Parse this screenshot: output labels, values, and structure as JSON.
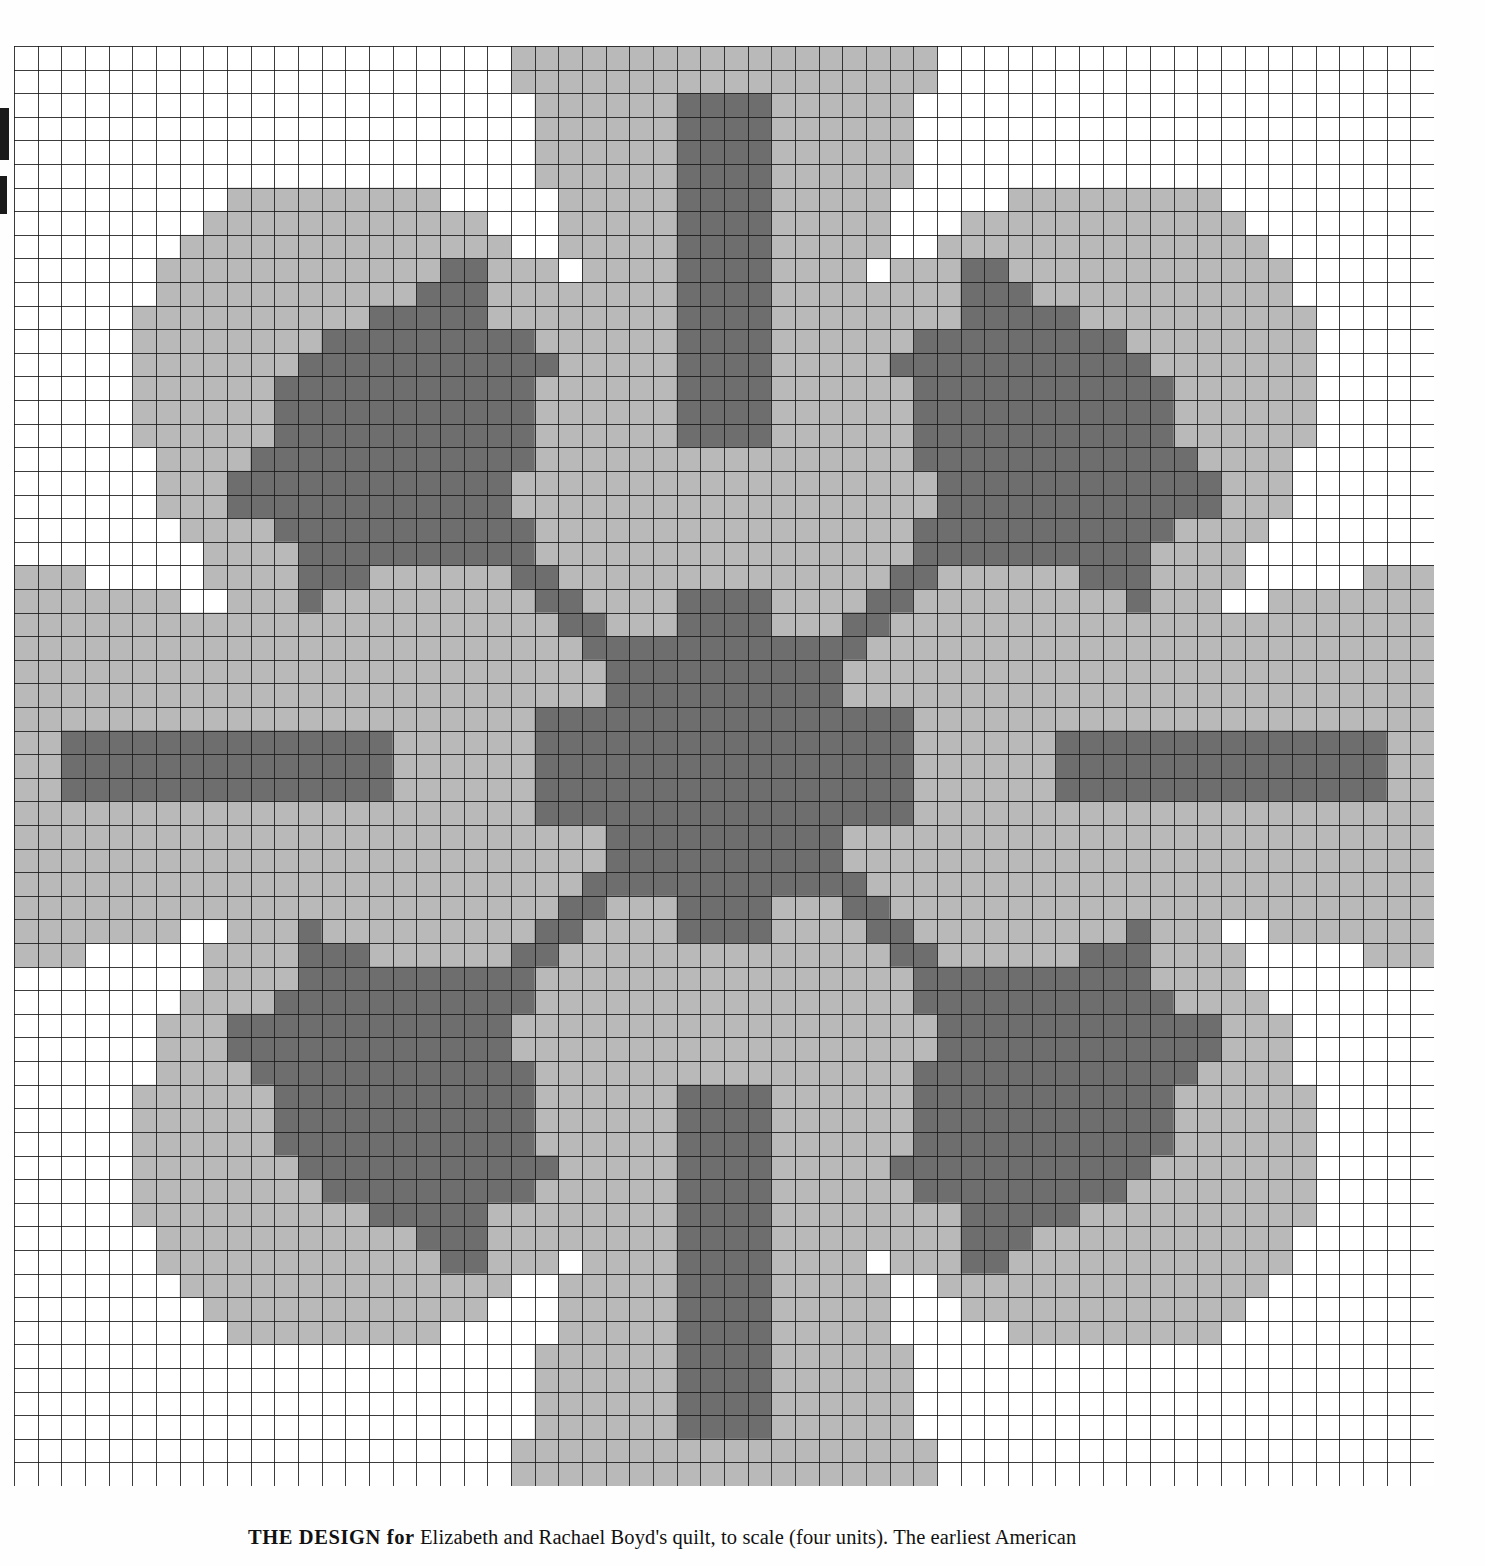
{
  "page": {
    "background_color": "#fefefe",
    "edge_marks": [
      "page-edge-smudge-upper",
      "page-edge-smudge-lower"
    ]
  },
  "caption": {
    "label": "THE DESIGN for",
    "text": "Elizabeth and Rachael Boyd's quilt, to scale (four units). The earliest American"
  },
  "chart_data": {
    "type": "heatmap",
    "title": "",
    "subtitle": "",
    "xlabel": "",
    "ylabel": "",
    "grid": true,
    "legend_position": "none",
    "cols": 60,
    "rows": 61,
    "cell_px": 23.6,
    "palette": {
      "empty": "#ffffff",
      "light": "#b9b9b9",
      "dark": "#6e6e6e",
      "grid_line": "#1a1a1a"
    },
    "value_levels": [
      0,
      1,
      2
    ],
    "level_names": [
      "background",
      "light-shade",
      "dark-shade"
    ],
    "axis_ranges": {
      "x": [
        0,
        60
      ],
      "y": [
        0,
        61
      ]
    },
    "symmetry": "4-fold mirror (horizontal and vertical)",
    "motif": {
      "center_block": {
        "x": [
          25,
          35
        ],
        "y": [
          28,
          37
        ],
        "level": 2
      },
      "diagonal_rays": 4,
      "cardinal_points": 4,
      "corner_fans": 4
    }
  }
}
